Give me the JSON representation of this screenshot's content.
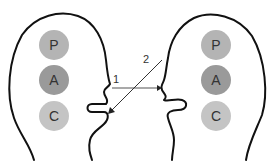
{
  "diagram": {
    "left_head": {
      "ego_states": [
        {
          "label": "P",
          "color": "#b4b4b4"
        },
        {
          "label": "A",
          "color": "#9a9a9a"
        },
        {
          "label": "C",
          "color": "#c4c4c4"
        }
      ]
    },
    "right_head": {
      "ego_states": [
        {
          "label": "P",
          "color": "#b4b4b4"
        },
        {
          "label": "A",
          "color": "#9a9a9a"
        },
        {
          "label": "C",
          "color": "#c4c4c4"
        }
      ]
    },
    "arrows": [
      {
        "label": "1",
        "from": "left mouth",
        "to": "right mouth"
      },
      {
        "label": "2",
        "from": "right",
        "to": "left mouth"
      }
    ]
  }
}
